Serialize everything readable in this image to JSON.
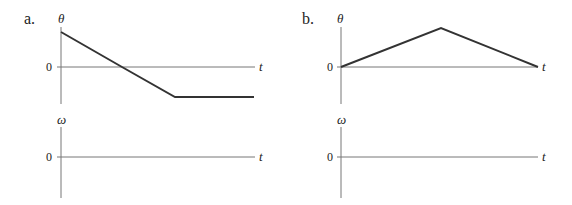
{
  "panels": [
    {
      "id": "a",
      "label": "a.",
      "theta_graph": {
        "y_label": "θ",
        "x_label": "t",
        "zero_label": "0",
        "curve_points": [
          [
            0,
            1.0
          ],
          [
            0.32,
            0.0
          ],
          [
            0.58,
            -0.85
          ],
          [
            1.0,
            -0.85
          ]
        ],
        "description": "θ starts positive, decreases linearly through zero, then levels off at a constant negative value"
      },
      "omega_graph": {
        "y_label": "ω",
        "x_label": "t",
        "zero_label": "0",
        "curve_points": [],
        "description": "Blank axes to be filled in"
      }
    },
    {
      "id": "b",
      "label": "b.",
      "theta_graph": {
        "y_label": "θ",
        "x_label": "t",
        "zero_label": "0",
        "curve_points": [
          [
            0,
            0.0
          ],
          [
            0.5,
            1.0
          ],
          [
            1.0,
            0.0
          ]
        ],
        "description": "θ increases linearly from zero to a peak, then decreases linearly back to zero"
      },
      "omega_graph": {
        "y_label": "ω",
        "x_label": "t",
        "zero_label": "0",
        "curve_points": [],
        "description": "Blank axes to be filled in"
      }
    }
  ]
}
